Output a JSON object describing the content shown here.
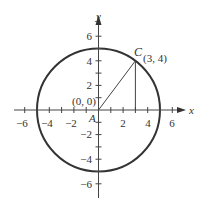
{
  "diagram": {
    "axes": {
      "x_label": "x",
      "y_label": "y",
      "x_ticks": [
        {
          "value": -6,
          "label": "−6"
        },
        {
          "value": -4,
          "label": "−4"
        },
        {
          "value": -2,
          "label": "−2"
        },
        {
          "value": 2,
          "label": "2"
        },
        {
          "value": 4,
          "label": "4"
        },
        {
          "value": 6,
          "label": "6"
        }
      ],
      "y_ticks": [
        {
          "value": 6,
          "label": "6"
        },
        {
          "value": 4,
          "label": "4"
        },
        {
          "value": 2,
          "label": "2"
        },
        {
          "value": -2,
          "label": "−2"
        },
        {
          "value": -4,
          "label": "−4"
        },
        {
          "value": -6,
          "label": "−6"
        }
      ],
      "range": [
        -6.5,
        7
      ]
    },
    "circle": {
      "center": [
        0,
        0
      ],
      "radius": 5
    },
    "points": {
      "A": {
        "label": "A",
        "coord_label": "(0, 0)",
        "x": 0,
        "y": 0
      },
      "C": {
        "label": "C",
        "coord_label": "(3, 4)",
        "x": 3,
        "y": 4
      }
    },
    "segments": [
      {
        "from": "A",
        "to": "C",
        "description": "radius line AC"
      },
      {
        "from": [
          3,
          4
        ],
        "to": [
          3,
          0
        ],
        "description": "vertical drop from C to x-axis"
      }
    ]
  }
}
